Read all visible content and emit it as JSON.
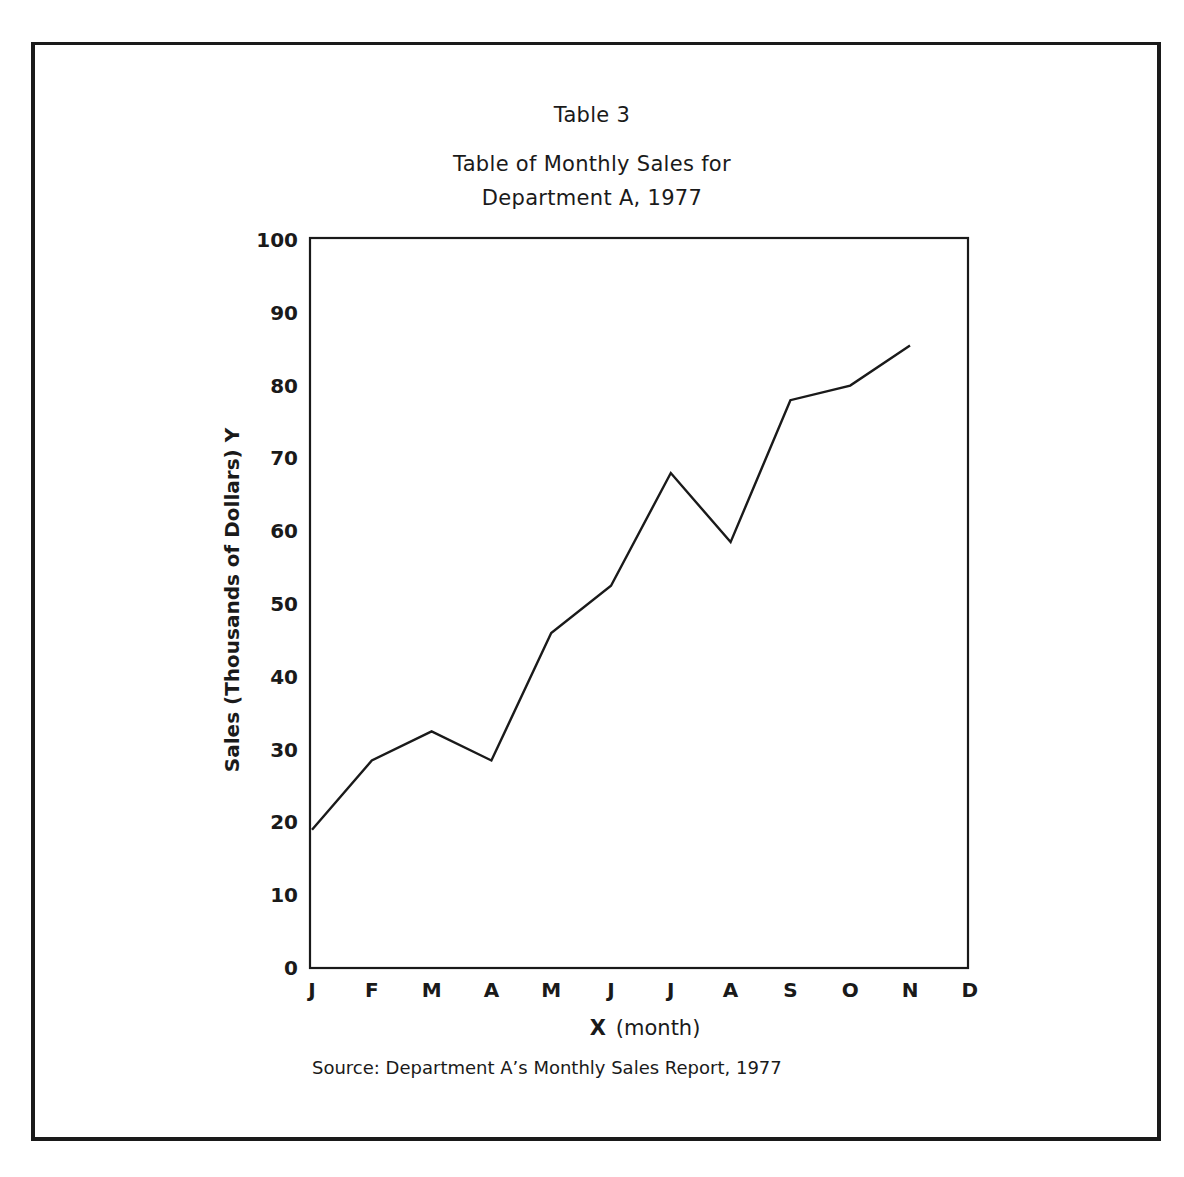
{
  "header": {
    "table_label": "Table 3",
    "title_line1": "Table of Monthly Sales for",
    "title_line2": "Department A, 1977"
  },
  "axes": {
    "y_label": "Sales (Thousands of Dollars)  Y",
    "x_label_var": "X",
    "x_label_unit": "(month)",
    "y_ticks": [
      "0",
      "10",
      "20",
      "30",
      "40",
      "50",
      "60",
      "70",
      "80",
      "90",
      "100"
    ],
    "x_ticks": [
      "J",
      "F",
      "M",
      "A",
      "M",
      "J",
      "J",
      "A",
      "S",
      "O",
      "N",
      "D"
    ]
  },
  "footer": {
    "source": "Source:  Department A’s Monthly Sales Report, 1977"
  },
  "colors": {
    "line": "#1a1a1a",
    "frame": "#1a1a1a",
    "background": "#ffffff"
  },
  "chart_data": {
    "type": "line",
    "xlabel": "X (month)",
    "ylabel": "Sales (Thousands of Dollars) Y",
    "categories": [
      "J",
      "F",
      "M",
      "A",
      "M",
      "J",
      "J",
      "A",
      "S",
      "O",
      "N",
      "D"
    ],
    "series": [
      {
        "name": "Department A Sales",
        "values": [
          19,
          28.5,
          32.5,
          28.5,
          46,
          52.5,
          68,
          58.5,
          78,
          80,
          85.5,
          null
        ]
      }
    ],
    "ylim": [
      0,
      100
    ],
    "yticks": [
      0,
      10,
      20,
      30,
      40,
      50,
      60,
      70,
      80,
      90,
      100
    ],
    "grid": false,
    "legend": null,
    "source": "Department A's Monthly Sales Report, 1977"
  }
}
